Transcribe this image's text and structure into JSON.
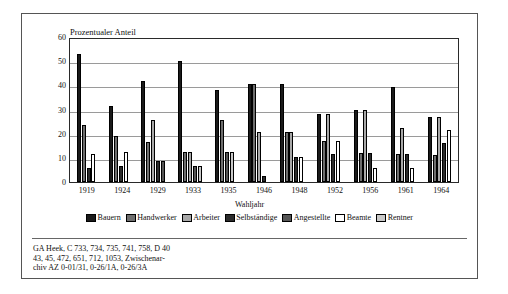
{
  "chart_data": {
    "type": "bar",
    "title": "Prozentualer Anteil",
    "ylabel": "Prozentualer Anteil",
    "xlabel": "Wahljahr",
    "ylim": [
      0,
      60
    ],
    "yticks": [
      "0",
      "10",
      "20",
      "30",
      "40",
      "50",
      "60"
    ],
    "grid": true,
    "legend_position": "bottom",
    "categories": [
      "1919",
      "1924",
      "1929",
      "1933",
      "1935",
      "1946",
      "1948",
      "1952",
      "1956",
      "1961",
      "1964"
    ],
    "series": [
      {
        "name": "Bauern",
        "color": "#1a1a1a",
        "values": [
          53,
          31.5,
          42,
          50,
          38,
          40.5,
          40.5,
          28,
          30,
          39.5,
          27
        ]
      },
      {
        "name": "Handwerker",
        "color": "#6e6e6e",
        "values": [
          23.5,
          19,
          16.5,
          12.5,
          25.5,
          40.5,
          20.5,
          17,
          12,
          11.5,
          11
        ]
      },
      {
        "name": "Arbeiter",
        "color": "#a8a8a8",
        "values": [
          0,
          0,
          25.5,
          12.5,
          0,
          20.5,
          20.5,
          28,
          30,
          22.5,
          27
        ]
      },
      {
        "name": "Selbständige",
        "color": "#2b2b2b",
        "values": [
          6,
          6.5,
          8.5,
          0,
          0,
          2.5,
          10.5,
          11.5,
          12,
          11.5,
          16
        ]
      },
      {
        "name": "Angestellte",
        "color": "#555555",
        "values": [
          0,
          0,
          8.5,
          6.5,
          12.5,
          0,
          0,
          0,
          0,
          0,
          0
        ]
      },
      {
        "name": "Beamte",
        "color": "#ffffff",
        "values": [
          11.5,
          12.5,
          0,
          0,
          0,
          0,
          10.5,
          17,
          6,
          6,
          21.5
        ]
      },
      {
        "name": "Rentner",
        "color": "#c9c9c9",
        "values": [
          0,
          0,
          0,
          6.5,
          12.5,
          0,
          0,
          0,
          0,
          0,
          0
        ]
      }
    ]
  },
  "legend": {
    "items": [
      {
        "label": "Bauern"
      },
      {
        "label": "Handwerker"
      },
      {
        "label": "Arbeiter"
      },
      {
        "label": "Selbständige"
      },
      {
        "label": "Angestellte"
      },
      {
        "label": "Beamte"
      },
      {
        "label": "Rentner"
      }
    ]
  },
  "source": {
    "lines": [
      "GA Heek, C 733, 734, 735, 741, 758, D 40",
      "43, 45, 472, 651, 712, 1053, Zwischenar-",
      "chiv AZ 0-01/31, 0-26/1A, 0-26/3A"
    ]
  }
}
